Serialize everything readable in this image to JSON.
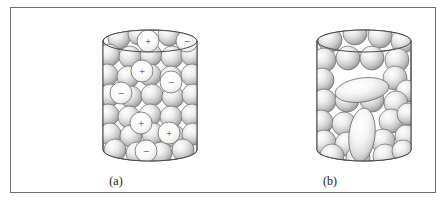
{
  "figure": {
    "background": "#ffffff",
    "border_color": "#6e6e6e",
    "kind": "illustration"
  },
  "panels": [
    {
      "id": "panel-a",
      "caption": "(a)",
      "cylinder": {
        "left": 92,
        "top": 22,
        "width": 94,
        "height": 131,
        "ellipse_ry": 11,
        "outline_color": "#4a4a4a"
      },
      "particles": {
        "shape": "sphere",
        "radius": 11,
        "count": 34,
        "fill_light": "#ffffff",
        "fill_mid": "#d8d8d8",
        "fill_dark": "#8f8f8f",
        "outline": "#6a6a6a"
      },
      "charges": [
        {
          "label": "+",
          "cx": 45,
          "cy": 11
        },
        {
          "label": "−",
          "cx": 84,
          "cy": 11
        },
        {
          "label": "+",
          "cx": 39,
          "cy": 41
        },
        {
          "label": "−",
          "cx": 68,
          "cy": 52
        },
        {
          "label": "−",
          "cx": 18,
          "cy": 63
        },
        {
          "label": "+",
          "cx": 38,
          "cy": 93
        },
        {
          "label": "+",
          "cx": 66,
          "cy": 103
        },
        {
          "label": "−",
          "cx": 43,
          "cy": 121
        }
      ],
      "charge_symbols": {
        "positive": "+",
        "negative": "−"
      }
    },
    {
      "id": "panel-b",
      "caption": "(b)",
      "cylinder": {
        "left": 92,
        "top": 22,
        "width": 94,
        "height": 131,
        "ellipse_ry": 11,
        "outline_color": "#4a4a4a"
      },
      "particles": {
        "shape": "sphere",
        "radius": 11,
        "count": 30,
        "fill_light": "#ffffff",
        "fill_mid": "#d8d8d8",
        "fill_dark": "#8f8f8f",
        "outline": "#6a6a6a"
      },
      "ellipsoids": [
        {
          "name": "horizontal-ellipsoid",
          "cx": 45,
          "cy": 60,
          "rx": 27,
          "ry": 12,
          "rotate": -8
        },
        {
          "name": "vertical-ellipsoid",
          "cx": 45,
          "cy": 105,
          "rx": 13,
          "ry": 27,
          "rotate": 6
        }
      ]
    }
  ]
}
